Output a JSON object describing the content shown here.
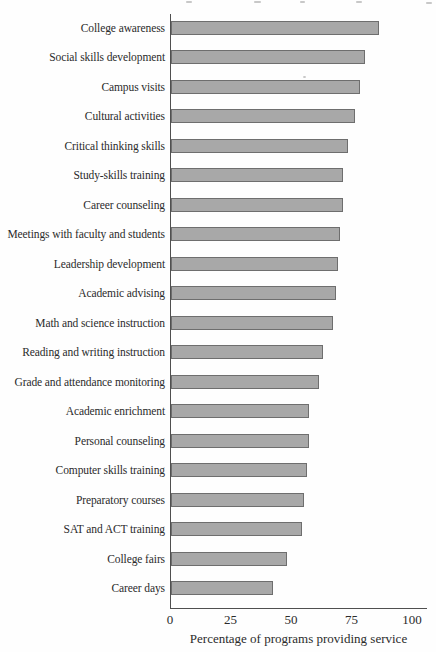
{
  "chart_data": {
    "type": "bar",
    "orientation": "horizontal",
    "title": "",
    "xlabel": "Percentage of programs providing service",
    "ylabel": "",
    "xlim": [
      0,
      100
    ],
    "x_ticks": [
      0,
      25,
      50,
      75,
      100
    ],
    "grid": false,
    "legend": "none",
    "categories": [
      "College awareness",
      "Social skills development",
      "Campus visits",
      "Cultural activities",
      "Critical thinking skills",
      "Study-skills training",
      "Career counseling",
      "Meetings with faculty and students",
      "Leadership development",
      "Academic advising",
      "Math and science instruction",
      "Reading and writing instruction",
      "Grade and attendance monitoring",
      "Academic enrichment",
      "Personal counseling",
      "Computer skills training",
      "Preparatory courses",
      "SAT and ACT training",
      "College fairs",
      "Career days"
    ],
    "values": [
      86,
      80,
      78,
      76,
      73,
      71,
      71,
      70,
      69,
      68,
      67,
      63,
      61,
      57,
      57,
      56,
      55,
      54,
      48,
      42
    ],
    "bar_fill": "#a8a8a8",
    "bar_border": "#6e6e6e",
    "axis_color": "#4f4f4f",
    "text_color": "#2b2b2b"
  }
}
